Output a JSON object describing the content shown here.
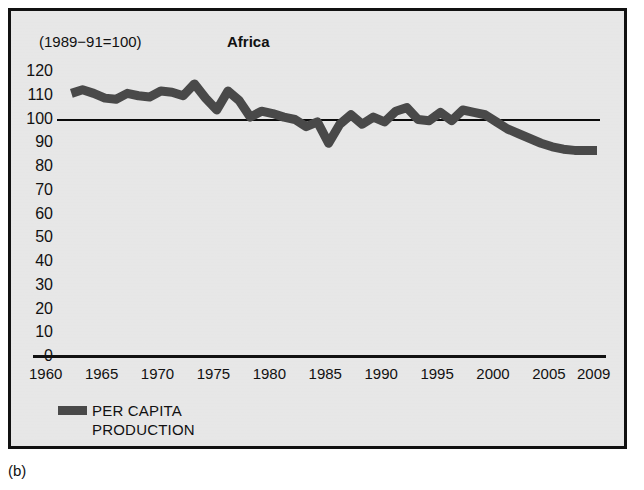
{
  "figure": {
    "caption": "(b)",
    "background_color": "#e9e9e9",
    "frame_color": "#111111"
  },
  "chart_data": {
    "type": "line",
    "title": "Africa",
    "subtitle": "(1989−91=100)",
    "xlabel": "",
    "ylabel": "",
    "index_base_note": "(1989−91=100)",
    "xlim": [
      1960,
      2009
    ],
    "ylim": [
      0,
      120
    ],
    "grid": false,
    "legend_position": "bottom-left",
    "reference_line": {
      "value": 100,
      "label": "100 index reference",
      "color": "#0b0b0b"
    },
    "ytick_labels": [
      "120",
      "110",
      "100",
      "90",
      "80",
      "70",
      "60",
      "50",
      "40",
      "30",
      "20",
      "10",
      "0"
    ],
    "ytick_values": [
      120,
      110,
      100,
      90,
      80,
      70,
      60,
      50,
      40,
      30,
      20,
      10,
      0
    ],
    "xtick_labels": [
      "1960",
      "1965",
      "1970",
      "1975",
      "1980",
      "1985",
      "1990",
      "1995",
      "2000",
      "2005",
      "2009"
    ],
    "xtick_values": [
      1960,
      1965,
      1970,
      1975,
      1980,
      1985,
      1990,
      1995,
      2000,
      2005,
      2009
    ],
    "series": [
      {
        "name": "PER CAPITA PRODUCTION",
        "legend_label_line1": "PER CAPITA",
        "legend_label_line2": "PRODUCTION",
        "color": "#4a4a4a",
        "x": [
          1962,
          1963,
          1964,
          1965,
          1966,
          1967,
          1968,
          1969,
          1970,
          1971,
          1972,
          1973,
          1974,
          1975,
          1976,
          1977,
          1978,
          1979,
          1980,
          1981,
          1982,
          1983,
          1984,
          1985,
          1986,
          1987,
          1988,
          1989,
          1990,
          1991,
          1992,
          1993,
          1994,
          1995,
          1996,
          1997,
          1998,
          1999,
          2000,
          2001,
          2002,
          2003,
          2004,
          2005,
          2006,
          2007,
          2008,
          2009
        ],
        "values": [
          111,
          112.5,
          111,
          109,
          108.5,
          111,
          110,
          109.5,
          112,
          111.5,
          110,
          115,
          109,
          104,
          112,
          108,
          101,
          103.5,
          102.5,
          101,
          100,
          97,
          99,
          90,
          98,
          102,
          98,
          101,
          99,
          103.5,
          105,
          100,
          99.5,
          103,
          99.5,
          104,
          103,
          102,
          99,
          96,
          94,
          92,
          90,
          88.5,
          87.5,
          87,
          87,
          87
        ]
      }
    ]
  },
  "legend": {
    "swatch_color": "#4a4a4a",
    "line1": "PER CAPITA",
    "line2": "PRODUCTION"
  }
}
